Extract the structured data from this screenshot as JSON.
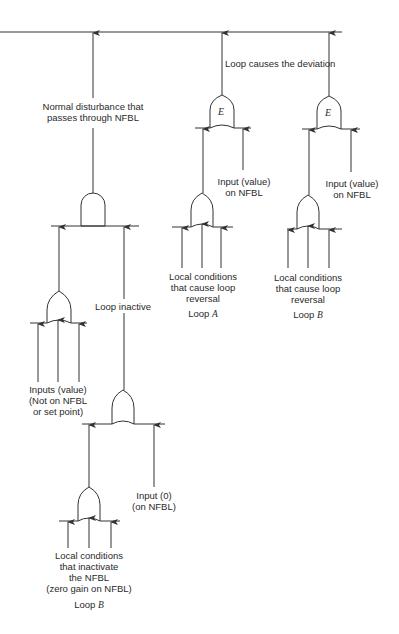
{
  "diagram": {
    "type": "fault-tree",
    "top_event_line": "top-event",
    "labels": {
      "normal_disturbance": [
        "Normal disturbance that",
        "passes through NFBL"
      ],
      "loop_causes_deviation": "Loop causes the deviation",
      "loop_inactive": "Loop inactive",
      "input_value_nfbl_a": [
        "Input (value)",
        "on NFBL"
      ],
      "input_value_nfbl_b": [
        "Input (value)",
        "on NFBL"
      ],
      "local_conditions_a": [
        "Local conditions",
        "that cause loop",
        "reversal"
      ],
      "local_conditions_b": [
        "Local conditions",
        "that cause loop",
        "reversal"
      ],
      "loop_a_label": "Loop",
      "loop_a_letter": "A",
      "loop_b_label": "Loop",
      "loop_b_letter": "B",
      "inputs_value": [
        "Inputs (value)",
        "(Not on NFBL",
        "or set point)"
      ],
      "input_zero": [
        "Input (0)",
        "(on NFBL)"
      ],
      "local_inactivate": [
        "Local conditions",
        "that inactivate",
        "the NFBL",
        "(zero gain on NFBL)"
      ],
      "loop_b2_label": "Loop",
      "loop_b2_letter": "B"
    },
    "gates": [
      {
        "id": "and-main",
        "type": "AND"
      },
      {
        "id": "or-inputs",
        "type": "OR"
      },
      {
        "id": "or-inactive",
        "type": "OR"
      },
      {
        "id": "or-local-inactivate",
        "type": "OR"
      },
      {
        "id": "e-loop-a",
        "type": "E",
        "letter": "E"
      },
      {
        "id": "e-loop-b",
        "type": "E",
        "letter": "E"
      },
      {
        "id": "or-loop-a",
        "type": "OR"
      },
      {
        "id": "or-loop-b",
        "type": "OR"
      }
    ],
    "colors": {
      "line": "#333333",
      "text": "#2a2a2a",
      "background": "#ffffff"
    }
  }
}
